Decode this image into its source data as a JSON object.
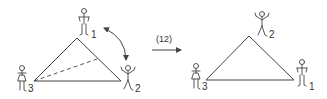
{
  "diagram": {
    "type": "permutation-of-triangle-vertices",
    "operation_label": "(12)",
    "colors": {
      "stroke": "#444444",
      "text": "#333333",
      "background": "#ffffff"
    },
    "left": {
      "vertex_labels": {
        "top": "1",
        "right": "2",
        "left": "3"
      },
      "has_dashed_median": true,
      "has_swap_arrow": true
    },
    "right": {
      "vertex_labels": {
        "top": "2",
        "right": "1",
        "left": "3"
      }
    }
  }
}
